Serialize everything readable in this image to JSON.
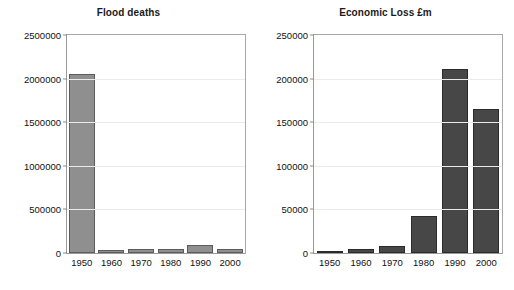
{
  "figure": {
    "background": "#ffffff",
    "width": 514,
    "height": 290
  },
  "colors": {
    "left_bar_fill": "#8f8f8f",
    "left_bar_edge": "#5c5c5c",
    "right_bar_fill": "#474747",
    "right_bar_edge": "#2b2b2b",
    "gridline": "#eceaea",
    "axis_frame": "#9a9a9a",
    "text": "#111111"
  },
  "chart_data": [
    {
      "type": "bar",
      "title": "Flood deaths",
      "xlabel": "",
      "ylabel": "",
      "categories": [
        "1950",
        "1960",
        "1970",
        "1980",
        "1990",
        "2000"
      ],
      "values": [
        2050000,
        30000,
        50000,
        50000,
        90000,
        45000
      ],
      "ylim": [
        0,
        2500000
      ],
      "yticks": [
        0,
        500000,
        1000000,
        1500000,
        2000000,
        2500000
      ],
      "ytick_labels": [
        "0",
        "500000",
        "1000000",
        "1500000",
        "2000000",
        "2500000"
      ],
      "grid": true,
      "legend": false,
      "bar_color": "#8f8f8f"
    },
    {
      "type": "bar",
      "title": "Economic Loss £m",
      "xlabel": "",
      "ylabel": "",
      "categories": [
        "1950",
        "1960",
        "1970",
        "1980",
        "1990",
        "2000"
      ],
      "values": [
        1500,
        4500,
        8500,
        43000,
        211000,
        165000
      ],
      "ylim": [
        0,
        250000
      ],
      "yticks": [
        0,
        50000,
        100000,
        150000,
        200000,
        250000
      ],
      "ytick_labels": [
        "0",
        "50000",
        "100000",
        "150000",
        "200000",
        "250000"
      ],
      "grid": true,
      "legend": false,
      "bar_color": "#474747"
    }
  ]
}
